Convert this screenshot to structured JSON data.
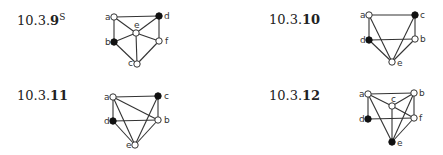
{
  "figures": [
    {
      "label_prefix": "10.3.",
      "label_bold": "9",
      "label_sup": "S",
      "label_pos": [
        17,
        12
      ],
      "nodes": [
        {
          "id": "a",
          "x": 114,
          "y": 17,
          "filled": false,
          "lx": -9,
          "ly": 3
        },
        {
          "id": "d",
          "x": 159,
          "y": 16,
          "filled": true,
          "lx": 5,
          "ly": 3
        },
        {
          "id": "e",
          "x": 136,
          "y": 33,
          "filled": false,
          "lx": -2,
          "ly": -5
        },
        {
          "id": "b",
          "x": 114,
          "y": 42,
          "filled": true,
          "lx": -9,
          "ly": 3
        },
        {
          "id": "f",
          "x": 159,
          "y": 41,
          "filled": false,
          "lx": 6,
          "ly": 3
        },
        {
          "id": "c",
          "x": 137,
          "y": 64,
          "filled": false,
          "lx": -9,
          "ly": 2
        }
      ],
      "edges": [
        [
          "a",
          "d"
        ],
        [
          "a",
          "b"
        ],
        [
          "a",
          "e"
        ],
        [
          "d",
          "e"
        ],
        [
          "d",
          "f"
        ],
        [
          "b",
          "e"
        ],
        [
          "e",
          "f"
        ],
        [
          "e",
          "c"
        ],
        [
          "b",
          "c"
        ],
        [
          "f",
          "c"
        ]
      ]
    },
    {
      "label_prefix": "10.3.",
      "label_bold": "10",
      "label_sup": "",
      "label_pos": [
        269,
        12
      ],
      "nodes": [
        {
          "id": "a",
          "x": 369,
          "y": 15,
          "filled": false,
          "lx": -9,
          "ly": 3
        },
        {
          "id": "c",
          "x": 415,
          "y": 15,
          "filled": true,
          "lx": 5,
          "ly": 3
        },
        {
          "id": "d",
          "x": 369,
          "y": 40,
          "filled": true,
          "lx": -9,
          "ly": 3
        },
        {
          "id": "b",
          "x": 415,
          "y": 39,
          "filled": false,
          "lx": 5,
          "ly": 3
        },
        {
          "id": "e",
          "x": 392,
          "y": 62,
          "filled": false,
          "lx": 5,
          "ly": 4
        }
      ],
      "edges": [
        [
          "a",
          "c"
        ],
        [
          "a",
          "d"
        ],
        [
          "a",
          "e"
        ],
        [
          "c",
          "b"
        ],
        [
          "c",
          "e"
        ],
        [
          "d",
          "b"
        ],
        [
          "d",
          "e"
        ],
        [
          "b",
          "e"
        ]
      ]
    },
    {
      "label_prefix": "10.3.",
      "label_bold": "11",
      "label_sup": "",
      "label_pos": [
        17,
        88
      ],
      "nodes": [
        {
          "id": "a",
          "x": 113,
          "y": 97,
          "filled": false,
          "lx": -9,
          "ly": 3
        },
        {
          "id": "c",
          "x": 158,
          "y": 96,
          "filled": true,
          "lx": 6,
          "ly": 3
        },
        {
          "id": "d",
          "x": 113,
          "y": 121,
          "filled": true,
          "lx": -9,
          "ly": 3
        },
        {
          "id": "b",
          "x": 158,
          "y": 120,
          "filled": false,
          "lx": 6,
          "ly": 3
        },
        {
          "id": "e",
          "x": 135,
          "y": 145,
          "filled": false,
          "lx": -9,
          "ly": 3
        }
      ],
      "edges": [
        [
          "a",
          "c"
        ],
        [
          "a",
          "b"
        ],
        [
          "a",
          "d"
        ],
        [
          "a",
          "e"
        ],
        [
          "c",
          "b"
        ],
        [
          "c",
          "e"
        ],
        [
          "d",
          "b"
        ],
        [
          "d",
          "e"
        ],
        [
          "b",
          "e"
        ]
      ]
    },
    {
      "label_prefix": "10.3.",
      "label_bold": "12",
      "label_sup": "",
      "label_pos": [
        269,
        88
      ],
      "nodes": [
        {
          "id": "a",
          "x": 368,
          "y": 94,
          "filled": false,
          "lx": -9,
          "ly": 3
        },
        {
          "id": "b",
          "x": 414,
          "y": 93,
          "filled": false,
          "lx": 5,
          "ly": 3
        },
        {
          "id": "c",
          "x": 392,
          "y": 106,
          "filled": false,
          "lx": -1,
          "ly": -4
        },
        {
          "id": "d",
          "x": 368,
          "y": 119,
          "filled": true,
          "lx": -9,
          "ly": 3
        },
        {
          "id": "f",
          "x": 414,
          "y": 118,
          "filled": false,
          "lx": 5,
          "ly": 3
        },
        {
          "id": "e",
          "x": 392,
          "y": 142,
          "filled": true,
          "lx": 5,
          "ly": 4
        }
      ],
      "edges": [
        [
          "a",
          "b"
        ],
        [
          "a",
          "c"
        ],
        [
          "a",
          "d"
        ],
        [
          "a",
          "e"
        ],
        [
          "b",
          "c"
        ],
        [
          "b",
          "f"
        ],
        [
          "b",
          "e"
        ],
        [
          "c",
          "f"
        ],
        [
          "c",
          "e"
        ],
        [
          "d",
          "f"
        ],
        [
          "f",
          "e"
        ]
      ]
    }
  ]
}
